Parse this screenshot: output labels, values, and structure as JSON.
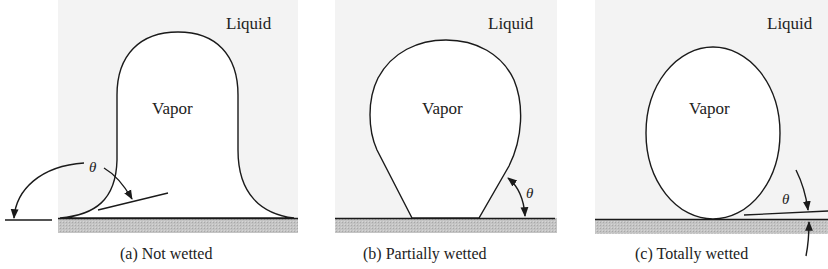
{
  "figure": {
    "colors": {
      "background": "#ffffff",
      "liquid": "#f3f3f3",
      "vapor": "#ffffff",
      "substrate": "#bdbdbd",
      "line": "#1a1a1a"
    },
    "panels": [
      {
        "id": "a",
        "liquid_label": "Liquid",
        "vapor_label": "Vapor",
        "angle_label": "θ",
        "caption": "(a)  Not wetted"
      },
      {
        "id": "b",
        "liquid_label": "Liquid",
        "vapor_label": "Vapor",
        "angle_label": "θ",
        "caption": "(b)  Partially wetted"
      },
      {
        "id": "c",
        "liquid_label": "Liquid",
        "vapor_label": "Vapor",
        "angle_label": "θ",
        "caption": "(c)  Totally wetted"
      }
    ]
  }
}
